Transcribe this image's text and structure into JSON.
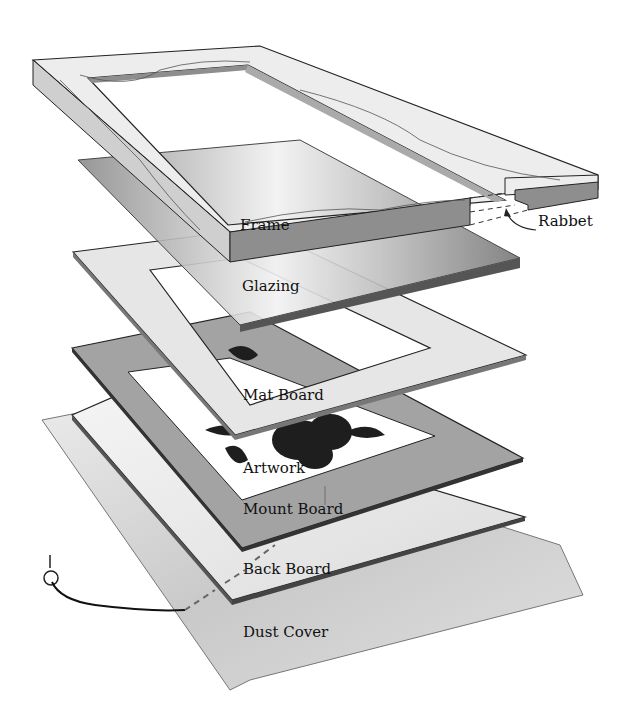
{
  "diagram": {
    "type": "exploded-view",
    "layers": [
      {
        "id": "frame",
        "label": "Frame"
      },
      {
        "id": "glazing",
        "label": "Glazing"
      },
      {
        "id": "mat_board",
        "label": "Mat Board"
      },
      {
        "id": "artwork",
        "label": "Artwork"
      },
      {
        "id": "mount_board",
        "label": "Mount Board"
      },
      {
        "id": "back_board",
        "label": "Back Board"
      },
      {
        "id": "dust_cover",
        "label": "Dust Cover"
      }
    ],
    "callouts": [
      {
        "id": "rabbet",
        "label": "Rabbet"
      }
    ],
    "hardware": [
      "screw-eye",
      "hanging-wire"
    ],
    "colors": {
      "frame_top": "#ededed",
      "frame_side": "#8e8e8e",
      "glazing": "#cfcfcf",
      "mat_board": "#e6e6e6",
      "mount_board": "#a3a3a3",
      "back_board": "#ededed",
      "dust_cover": "#d6d6d6",
      "outline": "#222222"
    }
  }
}
